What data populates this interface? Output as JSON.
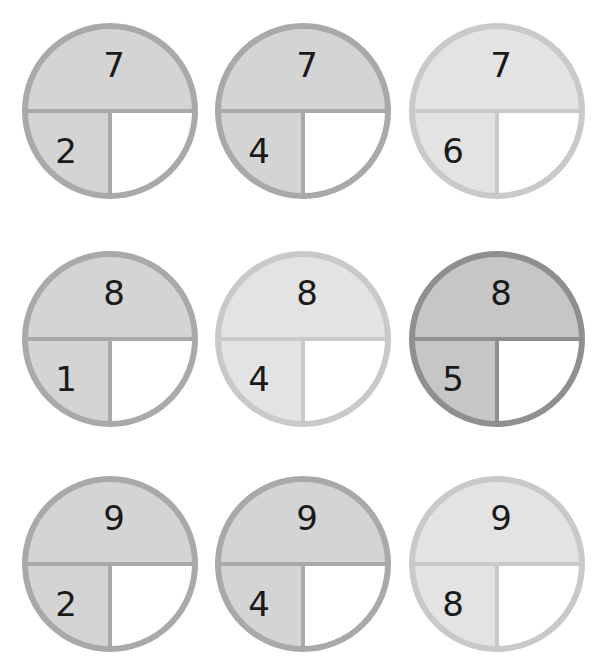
{
  "header": {
    "note": "cropped header (illegible)"
  },
  "colors": {
    "shade_light": "#e3e3e3",
    "shade_mid": "#d4d4d4",
    "shade_dark": "#c6c6c6",
    "ring_light": "#c9c9c9",
    "ring_mid": "#a9a9a9",
    "ring_dark": "#8f8f8f",
    "answer_fill": "#ffffff",
    "text": "#1a1a1a"
  },
  "bonds": [
    {
      "whole": "7",
      "part": "2",
      "missing": "",
      "tone": "mid"
    },
    {
      "whole": "7",
      "part": "4",
      "missing": "",
      "tone": "mid"
    },
    {
      "whole": "7",
      "part": "6",
      "missing": "",
      "tone": "light"
    },
    {
      "whole": "8",
      "part": "1",
      "missing": "",
      "tone": "mid"
    },
    {
      "whole": "8",
      "part": "4",
      "missing": "",
      "tone": "light"
    },
    {
      "whole": "8",
      "part": "5",
      "missing": "",
      "tone": "dark"
    },
    {
      "whole": "9",
      "part": "2",
      "missing": "",
      "tone": "mid"
    },
    {
      "whole": "9",
      "part": "4",
      "missing": "",
      "tone": "mid"
    },
    {
      "whole": "9",
      "part": "8",
      "missing": "",
      "tone": "light"
    }
  ]
}
